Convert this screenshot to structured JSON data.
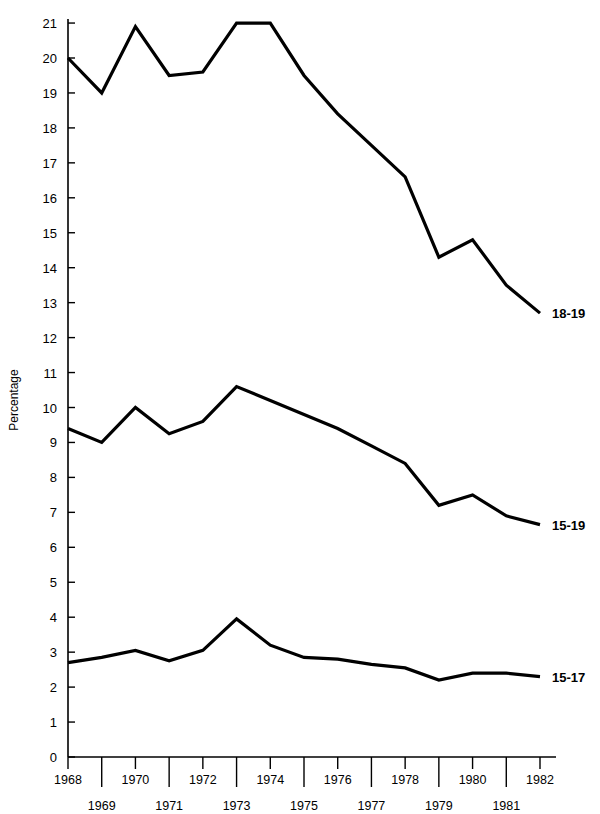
{
  "chart_data": {
    "type": "line",
    "title": "",
    "xlabel": "",
    "ylabel": "Percentage",
    "xlim": [
      1968,
      1982
    ],
    "ylim": [
      0,
      21
    ],
    "ytick_step": 1,
    "grid": false,
    "legend_position": "right-inline-end-of-line",
    "x": [
      1968,
      1969,
      1970,
      1971,
      1972,
      1973,
      1974,
      1975,
      1976,
      1977,
      1978,
      1979,
      1980,
      1981,
      1982
    ],
    "xtick_labels_top": [
      "1968",
      "1970",
      "1972",
      "1974",
      "1976",
      "1978",
      "1980",
      "1982"
    ],
    "xtick_labels_bottom": [
      "1969",
      "1971",
      "1973",
      "1975",
      "1977",
      "1979",
      "1981"
    ],
    "ytick_labels": [
      "0",
      "1",
      "2",
      "3",
      "4",
      "5",
      "6",
      "7",
      "8",
      "9",
      "10",
      "11",
      "12",
      "13",
      "14",
      "15",
      "16",
      "17",
      "18",
      "19",
      "20",
      "21"
    ],
    "series": [
      {
        "name": "18-19",
        "label": "18-19",
        "color": "#000000",
        "values": [
          20.0,
          19.0,
          20.9,
          19.5,
          19.6,
          21.0,
          21.0,
          19.5,
          18.4,
          17.5,
          16.6,
          14.3,
          14.8,
          13.5,
          12.7
        ]
      },
      {
        "name": "15-19",
        "label": "15-19",
        "color": "#000000",
        "values": [
          9.4,
          9.0,
          10.0,
          9.25,
          9.6,
          10.6,
          10.2,
          9.8,
          9.4,
          8.9,
          8.4,
          7.2,
          7.5,
          6.9,
          6.65
        ]
      },
      {
        "name": "15-17",
        "label": "15-17",
        "color": "#000000",
        "values": [
          2.7,
          2.85,
          3.05,
          2.75,
          3.05,
          3.95,
          3.2,
          2.85,
          2.8,
          2.65,
          2.55,
          2.2,
          2.4,
          2.4,
          2.3
        ]
      }
    ]
  },
  "axes": {
    "y_axis_title": "Percentage",
    "zero_label": "0"
  }
}
